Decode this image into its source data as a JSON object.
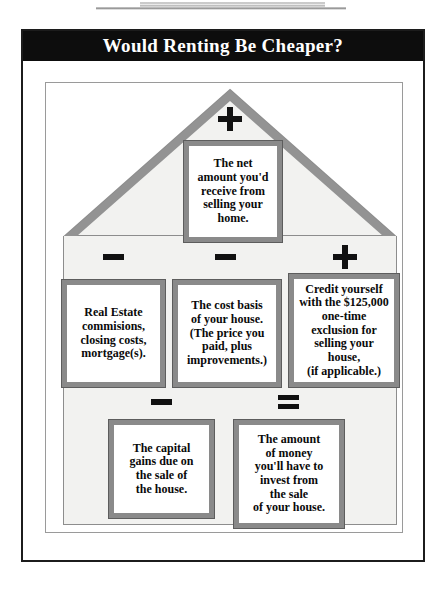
{
  "title": "Would Renting Be Cheaper?",
  "diagram": {
    "shape": "house",
    "boxes": [
      {
        "id": "net-amount",
        "operator": "+",
        "operator_name": "plus",
        "text": "The net\namount you'd\nreceive from\nselling your\nhome."
      },
      {
        "id": "commissions",
        "operator": "–",
        "operator_name": "minus",
        "text": "Real Estate\ncommisions,\nclosing costs,\nmortgage(s)."
      },
      {
        "id": "cost-basis",
        "operator": "–",
        "operator_name": "minus",
        "text": "The cost basis\nof your house.\n(The price you\npaid, plus\nimprovements.)"
      },
      {
        "id": "credit",
        "operator": "+",
        "operator_name": "plus",
        "text": "Credit yourself\nwith the $125,000\none-time\nexclusion for\nselling your\nhouse,\n(if applicable.)"
      },
      {
        "id": "capital-gains",
        "operator": "–",
        "operator_name": "minus",
        "text": "The capital\ngains due on\nthe sale of\nthe house."
      },
      {
        "id": "invest",
        "operator": "=",
        "operator_name": "equals",
        "text": "The amount\nof money\nyou'll have to\ninvest from\nthe sale\nof your house."
      }
    ]
  },
  "colors": {
    "title_bar_bg": "#0d0d0d",
    "title_text": "#ffffff",
    "box_border": "#8a8a8a",
    "box_bg": "#ffffff",
    "house_body_bg": "#f2f2f0",
    "roof_outline": "#8d8d8d",
    "operator": "#111111",
    "frame_border": "#1c1c1c",
    "inner_frame_border": "#9a9a9a"
  }
}
